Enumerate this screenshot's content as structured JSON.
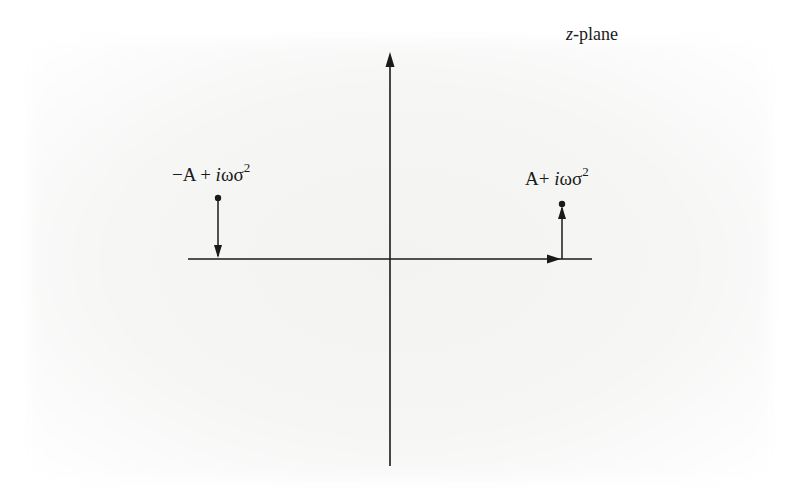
{
  "figure": {
    "title": "z-plane",
    "title_italic_part": "z",
    "title_rest": "-plane",
    "axes": {
      "horizontal": {
        "x1": 188,
        "x2": 592,
        "y": 259,
        "arrow_at_x": 558,
        "arrow_direction": "right"
      },
      "vertical": {
        "x": 390,
        "y1": 52,
        "y2": 466,
        "arrow_direction": "up"
      }
    },
    "points": [
      {
        "id": "left-pole",
        "label_prefix": "−A + ",
        "label_italic": "i",
        "label_greek": "ωσ",
        "label_superscript": "2",
        "x": 218,
        "y": 198,
        "arrow_from_y": 198,
        "arrow_to_y": 258,
        "arrow_direction": "down"
      },
      {
        "id": "right-pole",
        "label_prefix": "A+ ",
        "label_italic": "i",
        "label_greek": "ωσ",
        "label_superscript": "2",
        "x": 562,
        "y": 204,
        "arrow_from_y": 259,
        "arrow_to_y": 204,
        "arrow_direction": "up"
      }
    ],
    "colors": {
      "ink": "#1a1a1a",
      "background": "#ffffff",
      "paper_tint": "#f4f4f3"
    }
  }
}
